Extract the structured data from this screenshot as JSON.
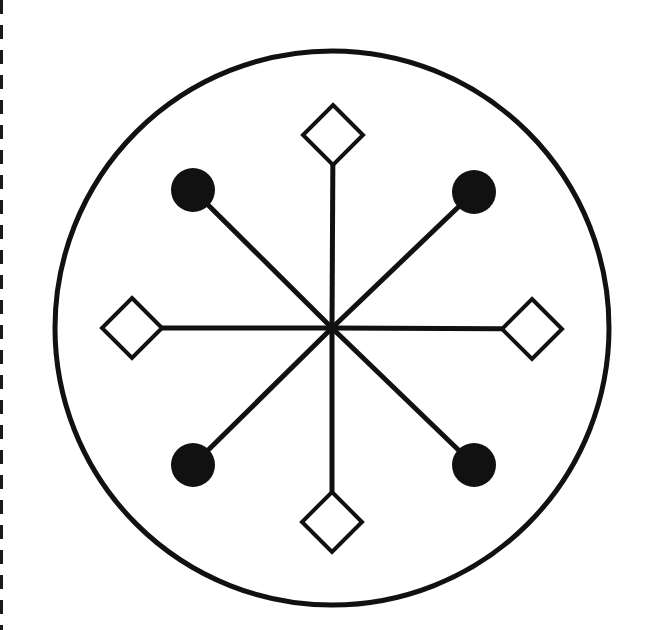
{
  "diagram": {
    "type": "radial-symbol",
    "stroke_color": "#111111",
    "fill_color": "#111111",
    "background": "#ffffff",
    "outer_circle": {
      "cx": 332,
      "cy": 328,
      "r": 277,
      "stroke_width": 5
    },
    "hub": {
      "cx": 332,
      "cy": 328
    },
    "spokes": [
      {
        "direction": "up",
        "end": "diamond",
        "x": 333,
        "y": 135
      },
      {
        "direction": "down",
        "end": "diamond",
        "x": 332,
        "y": 522
      },
      {
        "direction": "left",
        "end": "diamond",
        "x": 132,
        "y": 328
      },
      {
        "direction": "right",
        "end": "diamond",
        "x": 532,
        "y": 329
      },
      {
        "direction": "up-left",
        "end": "dot",
        "x": 193,
        "y": 190
      },
      {
        "direction": "up-right",
        "end": "dot",
        "x": 474,
        "y": 192
      },
      {
        "direction": "down-left",
        "end": "dot",
        "x": 193,
        "y": 465
      },
      {
        "direction": "down-right",
        "end": "dot",
        "x": 474,
        "y": 465
      }
    ],
    "diamond_half_size": 30,
    "dot_radius": 22,
    "spoke_width": 5
  }
}
